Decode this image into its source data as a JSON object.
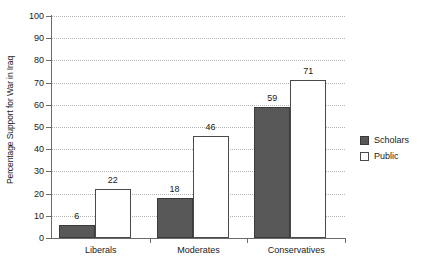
{
  "chart_data": {
    "type": "bar",
    "title": "",
    "xlabel": "",
    "ylabel": "Percentage Support for War in Iraq",
    "ylim": [
      0,
      100
    ],
    "ytick_step": 10,
    "yticks": [
      0,
      10,
      20,
      30,
      40,
      50,
      60,
      70,
      80,
      90,
      100
    ],
    "ytick_labels": [
      "0",
      "10",
      "20",
      "30",
      "40",
      "50",
      "60",
      "70",
      "80",
      "90",
      "100"
    ],
    "categories": [
      "Liberals",
      "Moderates",
      "Conservatives"
    ],
    "series": [
      {
        "name": "Scholars",
        "values": [
          6,
          18,
          59
        ],
        "color": "#585858"
      },
      {
        "name": "Public",
        "values": [
          22,
          46,
          71
        ],
        "color": "#ffffff"
      }
    ],
    "data_labels": [
      "6",
      "22",
      "18",
      "46",
      "59",
      "71"
    ],
    "grid": true,
    "grid_style": "dotted-horizontal",
    "legend_position": "right"
  },
  "legend": {
    "entries": [
      {
        "label": "Scholars",
        "swatch": "filled-dark-square"
      },
      {
        "label": "Public",
        "swatch": "outlined-white-square"
      }
    ]
  },
  "colors": {
    "scholars_fill": "#585858",
    "scholars_stroke": "#3b3b3b",
    "public_fill": "#ffffff",
    "public_stroke": "#4a4a4a",
    "axis": "#6b6b6b",
    "grid": "#b4b4b4",
    "text": "#1a1a1a",
    "background": "#ffffff"
  }
}
